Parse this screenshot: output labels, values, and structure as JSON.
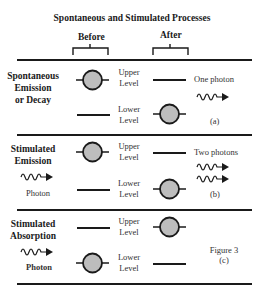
{
  "title": "Spontaneous and Stimulated Processes",
  "columns": {
    "before": "Before",
    "after": "After"
  },
  "levels": {
    "upper": [
      "Upper",
      "Level"
    ],
    "lower": [
      "Lower",
      "Level"
    ]
  },
  "panels": [
    {
      "id": "a",
      "process": [
        "Spontaneous",
        "Emission",
        "or Decay"
      ],
      "incoming": null,
      "outgoing_label": "One photon",
      "outgoing_photons": 1,
      "tag": "(a)"
    },
    {
      "id": "b",
      "process": [
        "Stimulated",
        "Emission"
      ],
      "incoming": "Photon",
      "outgoing_label": "Two photons",
      "outgoing_photons": 2,
      "tag": "(b)"
    },
    {
      "id": "c",
      "process": [
        "Stimulated",
        "Absorption"
      ],
      "incoming": "Photon",
      "outgoing_label": null,
      "figure_label": "Figure 3",
      "tag": "(c)"
    }
  ],
  "colors": {
    "atom_fill": "#bdbdbd",
    "stroke": "#1a1a1a"
  }
}
